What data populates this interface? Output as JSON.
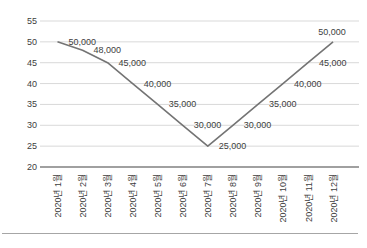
{
  "chart_data": {
    "type": "line",
    "title": "",
    "xlabel": "",
    "ylabel": "",
    "categories": [
      "2020년 1월",
      "2020년 2월",
      "2020년 3월",
      "2020년 4월",
      "2020년 5월",
      "2020년 6월",
      "2020년 7월",
      "2020년 8월",
      "2020년 9월",
      "2020년 10월",
      "2020년 11월",
      "2020년 12월"
    ],
    "series": [
      {
        "name": "monthly-values",
        "values": [
          50000,
          48000,
          45000,
          40000,
          35000,
          30000,
          25000,
          30000,
          35000,
          40000,
          45000,
          50000
        ],
        "plotted_values": [
          50,
          48,
          45,
          40,
          35,
          30,
          25,
          30,
          35,
          40,
          45,
          50
        ],
        "data_labels": [
          "50,000",
          "48,000",
          "45,000",
          "40,000",
          "35,000",
          "30,000",
          "25,000",
          "30,000",
          "35,000",
          "40,000",
          "45,000",
          "50,000"
        ],
        "color": "#747474"
      }
    ],
    "y_axis": {
      "min": 20,
      "max": 55,
      "step": 5,
      "tick_labels": [
        "20",
        "25",
        "30",
        "35",
        "40",
        "45",
        "50",
        "55"
      ]
    },
    "grid": true,
    "legend_position": "none",
    "data_label_position": "right",
    "colors": {
      "gridline": "#d9d9d9",
      "axis_line": "#808080",
      "tick_text": "#404040",
      "data_label_text": "#404040",
      "bottom_rule": "#a6a6a6",
      "background": "#ffffff"
    }
  }
}
